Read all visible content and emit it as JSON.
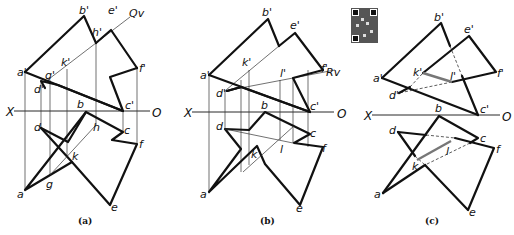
{
  "figure": {
    "panels": [
      {
        "caption": "(a)",
        "axis": {
          "left": "X",
          "right": "O"
        },
        "plane_trace": "Qv",
        "labels": {
          "a1": "a'",
          "b1": "b'",
          "c1": "c'",
          "d1": "d'",
          "e1": "e'",
          "f1": "f'",
          "g1": "g'",
          "h1": "h'",
          "k1": "k'",
          "a": "a",
          "b": "b",
          "c": "c",
          "d": "d",
          "e": "e",
          "f": "f",
          "g": "g",
          "h": "h",
          "k": "k"
        }
      },
      {
        "caption": "(b)",
        "axis": {
          "left": "X",
          "right": "O"
        },
        "plane_trace": "Rv",
        "labels": {
          "a1": "a'",
          "b1": "b'",
          "c1": "c'",
          "d1": "d'",
          "e1": "e'",
          "f1": "f'",
          "k1": "k'",
          "l1": "l'",
          "a": "a",
          "b": "b",
          "c": "c",
          "d": "d",
          "e": "e",
          "f": "f",
          "k": "k",
          "l": "l"
        }
      },
      {
        "caption": "(c)",
        "axis": {
          "left": "X",
          "right": "O"
        },
        "labels": {
          "a1": "a'",
          "b1": "b'",
          "c1": "c'",
          "d1": "d'",
          "e1": "e'",
          "f1": "f'",
          "k1": "k'",
          "l1": "l'",
          "a": "a",
          "b": "b",
          "c": "c",
          "d": "d",
          "e": "e",
          "f": "f",
          "k": "k",
          "l": "l"
        }
      }
    ],
    "qr_code": "qr-code-image"
  }
}
